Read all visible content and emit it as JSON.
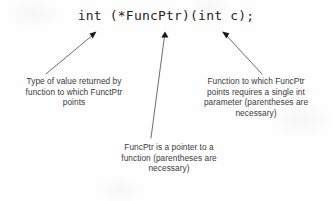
{
  "diagram": {
    "code": "int (*FuncPtr)(int c);",
    "ink_color": "#2b2b2b",
    "background_color": "#fefefe"
  },
  "captions": {
    "left": {
      "target": "int",
      "lines": [
        "Type of value returned by",
        "function to which FunctPtr",
        "points"
      ]
    },
    "center": {
      "target": "*FuncPtr",
      "lines": [
        "FuncPtr is a pointer  to a",
        "function (parentheses are",
        "necessary)"
      ]
    },
    "right": {
      "target": "(int c)",
      "lines": [
        "Function to which FuncPtr",
        "points requires a single int",
        "parameter (parentheses are",
        "necessary)"
      ]
    }
  },
  "arrows": [
    {
      "name": "arrow-to-return-type",
      "from_x": 46,
      "from_y": 74,
      "to_x": 95,
      "to_y": 32
    },
    {
      "name": "arrow-to-pointer-name",
      "from_x": 151,
      "from_y": 138,
      "to_x": 165,
      "to_y": 32
    },
    {
      "name": "arrow-to-parameter-list",
      "from_x": 262,
      "from_y": 74,
      "to_x": 223,
      "to_y": 32
    }
  ]
}
